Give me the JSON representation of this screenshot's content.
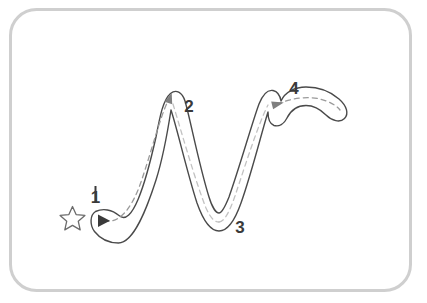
{
  "worksheet": {
    "title": "Letter tracing practice card",
    "letter": "N",
    "border": {
      "name": "rounded-card-border",
      "color": "#cfcfcf",
      "radius": 26,
      "thickness": 3
    },
    "canvas": {
      "background": "#ffffff",
      "width": 427,
      "height": 303
    },
    "letter_outline": {
      "name": "letter-outline",
      "color": "#4a4a4a",
      "fill": "#ffffff",
      "thickness": 1.4
    },
    "guide_path": {
      "name": "dashed-guide-path",
      "color": "#9a9a9a",
      "dash": "5 4",
      "thickness": 1.3
    },
    "start_marker": {
      "name": "start-star",
      "icon": "star-icon",
      "color": "#5a5a5a",
      "label": "start here"
    },
    "stroke_labels": [
      {
        "id": "stroke-label-1",
        "text": "1",
        "x": 95,
        "y": 201
      },
      {
        "id": "stroke-label-2",
        "text": "2",
        "x": 189,
        "y": 106
      },
      {
        "id": "stroke-label-3",
        "text": "3",
        "x": 237,
        "y": 227
      },
      {
        "id": "stroke-label-4",
        "text": "4",
        "x": 289,
        "y": 88
      }
    ],
    "arrows": [
      {
        "id": "arrow-1",
        "name": "direction-arrow-start",
        "x": 101,
        "y": 220,
        "angle": 0
      },
      {
        "id": "arrow-2",
        "name": "direction-arrow-peak",
        "x": 172,
        "y": 100,
        "angle": -70
      },
      {
        "id": "arrow-4",
        "name": "direction-arrow-hook",
        "x": 276,
        "y": 103,
        "angle": 8
      }
    ]
  }
}
